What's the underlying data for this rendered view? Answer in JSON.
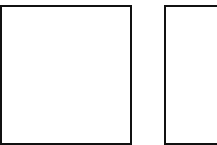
{
  "canvas": {
    "width": 217,
    "height": 145,
    "background": "#ffffff"
  },
  "shapes": [
    {
      "id": "left-square",
      "type": "rectangle",
      "fill": "#ffffff",
      "stroke": "#111111",
      "label": ""
    },
    {
      "id": "right-square",
      "type": "rectangle",
      "fill": "#ffffff",
      "stroke": "#111111",
      "label": "",
      "clipped": true
    }
  ]
}
